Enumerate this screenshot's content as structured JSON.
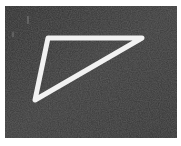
{
  "image": {
    "alt": "White triangular frame on dark textured surface",
    "background_color": "#3a3a3a",
    "frame_color": "#f2f2f2",
    "border_color": "#ffffff",
    "shape": "triangle-icon",
    "vertices": [
      [
        43,
        32
      ],
      [
        137,
        32
      ],
      [
        30,
        94
      ]
    ],
    "frame_thickness": 5
  }
}
